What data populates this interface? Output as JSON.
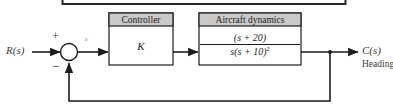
{
  "figure": {
    "type": "control-system-block-diagram",
    "colors": {
      "background": "#ffffff",
      "line": "#1d1d1d",
      "header_fill": "#c9c9c9",
      "block_fill": "#ffffff",
      "label_text": "#3a3a3a"
    }
  },
  "signals": {
    "input_label": "R(s)",
    "output_label": "C(s)",
    "output_sublabel": "Heading",
    "error_label": "e"
  },
  "summing_junction": {
    "name": "summing-junction",
    "positive_sign": "+",
    "negative_sign": "−"
  },
  "blocks": [
    {
      "id": "controller",
      "title": "Controller",
      "body": "K"
    },
    {
      "id": "aircraft-dynamics",
      "title": "Aircraft dynamics",
      "transfer_function": {
        "numerator": "(s + 20)",
        "denominator_base": "s(s + 10)",
        "denominator_exponent": "2"
      }
    }
  ],
  "feedback": {
    "type": "unity",
    "gain": "1"
  }
}
